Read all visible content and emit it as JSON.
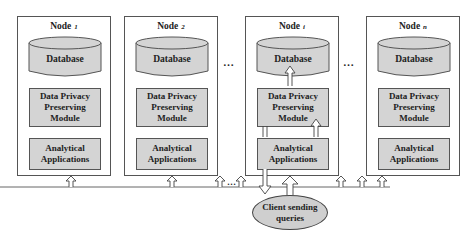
{
  "diagram": {
    "nodes": [
      {
        "title": "Node",
        "sub": "1",
        "database": "Database",
        "module_line1": "Data Privacy",
        "module_line2": "Preserving",
        "module_line3": "Module",
        "apps_line1": "Analytical",
        "apps_line2": "Applications"
      },
      {
        "title": "Node",
        "sub": "2",
        "database": "Database",
        "module_line1": "Data Privacy",
        "module_line2": "Preserving",
        "module_line3": "Module",
        "apps_line1": "Analytical",
        "apps_line2": "Applications"
      },
      {
        "title": "Node",
        "sub": "i",
        "database": "Database",
        "module_line1": "Data Privacy",
        "module_line2": "Preserving",
        "module_line3": "Module",
        "apps_line1": "Analytical",
        "apps_line2": "Applications"
      },
      {
        "title": "Node",
        "sub": "n",
        "database": "Database",
        "module_line1": "Data Privacy",
        "module_line2": "Preserving",
        "module_line3": "Module",
        "apps_line1": "Analytical",
        "apps_line2": "Applications"
      }
    ],
    "ellipsis": "…",
    "client": {
      "line1": "Client sending",
      "line2": "queries"
    },
    "colors": {
      "fill": "#d4d4d4",
      "stroke": "#555555",
      "background": "#ffffff"
    }
  }
}
